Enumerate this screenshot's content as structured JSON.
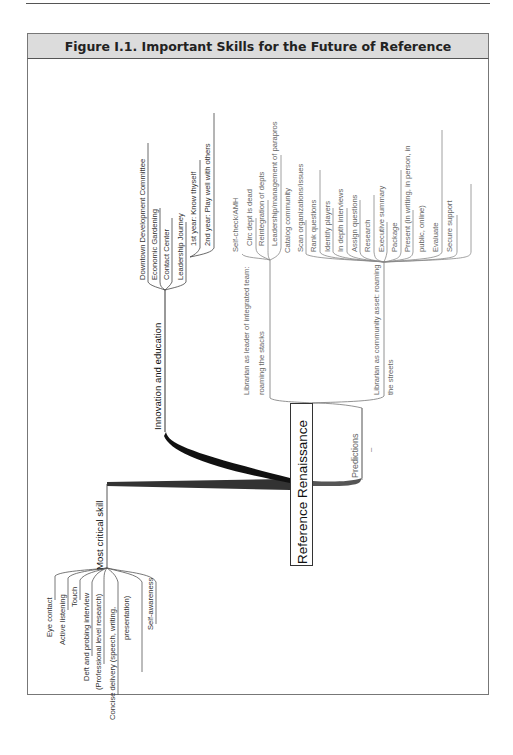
{
  "figure": {
    "title": "Figure I.1.  Important Skills for the Future of Reference",
    "root": "Reference Renaissance"
  },
  "branches": {
    "most_critical": {
      "label": "Most critical skill",
      "items": [
        "Eye contact",
        "Active listening",
        "Touch",
        "Deft and probing interview",
        "(Professional level research)",
        "Concise delivery (speech, writing,",
        "presentation)",
        "Self-awareness"
      ]
    },
    "innovation": {
      "label": "Innovation and education",
      "items": [
        "Downtown Development Committee",
        "Economic Gardening",
        "Contact Center",
        "Leadership Journey"
      ],
      "journey": [
        "1st year: Know thyself",
        "2nd year: Play well with others"
      ]
    },
    "predictions": {
      "label": "Predictions",
      "dash": "–",
      "leader": {
        "label_line1": "Librarian as leader of integrated team:",
        "label_line2": "roaming the stacks",
        "items": [
          "Self-check/AMH",
          "Circ dept is dead",
          "Reintegration of depts",
          "Leadership/management of parapros"
        ]
      },
      "community": {
        "label_line1": "Librarian as community asset: roaming",
        "label_line2": "the streets",
        "items": [
          "Catalog community",
          "Scan organizations/issues",
          "Rank questions",
          "Identify players",
          "In depth interviews",
          "Assign questions",
          "Research",
          "Executive summary",
          "Package",
          "Present (in writing, in person, in",
          "public, online)",
          "Evaluate",
          "Secure support"
        ]
      }
    }
  },
  "colors": {
    "header_bg": "#dcdcdc",
    "border": "#777777",
    "line": "#555555",
    "trunk": "#222222"
  }
}
